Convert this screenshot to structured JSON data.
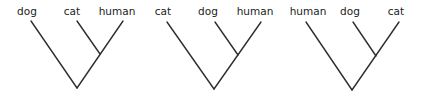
{
  "diagram": {
    "type": "phylogenetic-trees",
    "line_color": "#2e2e2e",
    "text_color": "#222222",
    "trees": [
      {
        "leaves": [
          {
            "label": "dog",
            "tx": 27,
            "ty": 15,
            "x": 31,
            "y": 21
          },
          {
            "label": "cat",
            "tx": 72,
            "ty": 15,
            "x": 77,
            "y": 21
          },
          {
            "label": "human",
            "tx": 117,
            "ty": 15,
            "x": 123,
            "y": 21
          }
        ],
        "node": {
          "x": 100,
          "y": 54
        },
        "root": {
          "x": 77,
          "y": 88
        }
      },
      {
        "leaves": [
          {
            "label": "cat",
            "tx": 163,
            "ty": 15,
            "x": 167,
            "y": 22
          },
          {
            "label": "dog",
            "tx": 208,
            "ty": 15,
            "x": 215,
            "y": 22
          },
          {
            "label": "human",
            "tx": 255,
            "ty": 15,
            "x": 261,
            "y": 22
          }
        ],
        "node": {
          "x": 238,
          "y": 55
        },
        "root": {
          "x": 214,
          "y": 89
        }
      },
      {
        "leaves": [
          {
            "label": "human",
            "tx": 308,
            "ty": 15,
            "x": 306,
            "y": 22
          },
          {
            "label": "dog",
            "tx": 350,
            "ty": 15,
            "x": 353,
            "y": 22
          },
          {
            "label": "cat",
            "tx": 396,
            "ty": 15,
            "x": 399,
            "y": 22
          }
        ],
        "node": {
          "x": 376,
          "y": 56
        },
        "root": {
          "x": 352,
          "y": 90
        }
      }
    ]
  }
}
